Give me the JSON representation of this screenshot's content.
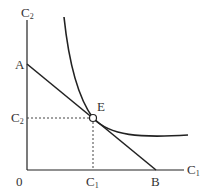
{
  "diagram": {
    "type": "indifference-curve-budget-line",
    "axes": {
      "y_label": "C",
      "y_sub": "2",
      "x_label": "C",
      "x_sub": "1",
      "origin_label": "0"
    },
    "points": {
      "A": "A",
      "B": "B",
      "E": "E"
    },
    "guides": {
      "c2_label": "C",
      "c2_sub": "2",
      "c1_label": "C",
      "c1_sub": "1"
    },
    "colors": {
      "line": "#222222",
      "text": "#333333"
    }
  }
}
